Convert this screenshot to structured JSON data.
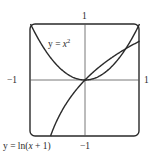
{
  "chart_data": {
    "type": "line",
    "title": "",
    "xlabel": "",
    "ylabel": "",
    "xlim": [
      -1,
      1
    ],
    "ylim": [
      -1,
      1
    ],
    "grid": false,
    "axis_tick_labels": {
      "top": "1",
      "bottom": "−1",
      "left": "−1",
      "right": "1"
    },
    "series": [
      {
        "name": "y = x²",
        "function": "x^2",
        "x": [
          -1,
          -0.5,
          0,
          0.5,
          1
        ],
        "y": [
          1,
          0.25,
          0,
          0.25,
          1
        ]
      },
      {
        "name": "y = ln(x + 1)",
        "function": "ln(x+1)",
        "x": [
          -0.63,
          -0.5,
          0,
          0.5,
          0.72,
          1
        ],
        "y": [
          -1,
          -0.69,
          0,
          0.41,
          0.54,
          0.69
        ]
      }
    ],
    "annotations": [
      {
        "text": "y = x²",
        "near_series": 0
      },
      {
        "text": "y = ln(x + 1)",
        "near_series": 1
      }
    ],
    "colors": {
      "curve": "#2a2a2a",
      "axis": "#444444",
      "frame": "#2a2a2a",
      "background": "#ffffff"
    }
  },
  "labels": {
    "tick_top": "1",
    "tick_bottom": "−1",
    "tick_left": "−1",
    "tick_right": "1",
    "curve1_lhs": "y = ",
    "curve1_var": "x",
    "curve1_exp": "2",
    "curve2_lhs": "y = ln(",
    "curve2_var": "x",
    "curve2_rhs": " + 1)"
  }
}
